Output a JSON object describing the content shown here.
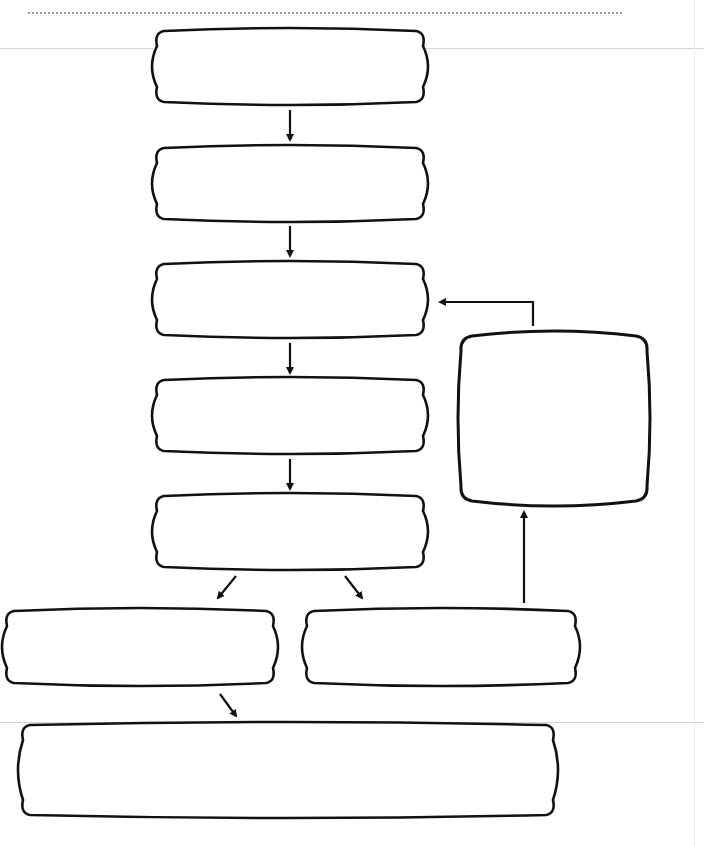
{
  "diagram": {
    "type": "flowchart",
    "title": "",
    "header_rule": "dotted",
    "stroke_color": "#111111",
    "background": "#ffffff",
    "nodes": [
      {
        "id": "n1",
        "label": "",
        "x": 152,
        "y": 28,
        "w": 276,
        "h": 77,
        "shape": "rounded-bulge"
      },
      {
        "id": "n2",
        "label": "",
        "x": 152,
        "y": 145,
        "w": 276,
        "h": 77,
        "shape": "rounded-bulge"
      },
      {
        "id": "n3",
        "label": "",
        "x": 152,
        "y": 261,
        "w": 276,
        "h": 77,
        "shape": "rounded-bulge"
      },
      {
        "id": "n4",
        "label": "",
        "x": 152,
        "y": 377,
        "w": 276,
        "h": 77,
        "shape": "rounded-bulge"
      },
      {
        "id": "n5",
        "label": "",
        "x": 152,
        "y": 493,
        "w": 276,
        "h": 77,
        "shape": "rounded-bulge"
      },
      {
        "id": "n6",
        "label": "",
        "x": 2,
        "y": 608,
        "w": 276,
        "h": 78,
        "shape": "rounded-bulge"
      },
      {
        "id": "n7",
        "label": "",
        "x": 302,
        "y": 608,
        "w": 278,
        "h": 78,
        "shape": "rounded-bulge"
      },
      {
        "id": "n8",
        "label": "",
        "x": 458,
        "y": 331,
        "w": 192,
        "h": 175,
        "shape": "rounded-square"
      },
      {
        "id": "n9",
        "label": "",
        "x": 18,
        "y": 722,
        "w": 540,
        "h": 96,
        "shape": "rounded-bulge"
      }
    ],
    "edges": [
      {
        "from": "n1",
        "to": "n2",
        "path": [
          [
            290,
            110
          ],
          [
            290,
            140
          ]
        ]
      },
      {
        "from": "n2",
        "to": "n3",
        "path": [
          [
            290,
            226
          ],
          [
            290,
            256
          ]
        ]
      },
      {
        "from": "n3",
        "to": "n4",
        "path": [
          [
            290,
            343
          ],
          [
            290,
            373
          ]
        ]
      },
      {
        "from": "n4",
        "to": "n5",
        "path": [
          [
            290,
            459
          ],
          [
            290,
            489
          ]
        ]
      },
      {
        "from": "n5",
        "to": "n6",
        "path": [
          [
            236,
            576
          ],
          [
            218,
            598
          ]
        ]
      },
      {
        "from": "n5",
        "to": "n7",
        "path": [
          [
            345,
            576
          ],
          [
            362,
            598
          ]
        ]
      },
      {
        "from": "n7",
        "to": "n8",
        "path": [
          [
            524,
            603
          ],
          [
            524,
            512
          ]
        ]
      },
      {
        "from": "n8",
        "to": "n3",
        "path": [
          [
            533,
            326
          ],
          [
            533,
            302
          ],
          [
            440,
            302
          ]
        ]
      },
      {
        "from": "n6",
        "to": "n9",
        "path": [
          [
            220,
            694
          ],
          [
            236,
            716
          ]
        ]
      }
    ]
  }
}
